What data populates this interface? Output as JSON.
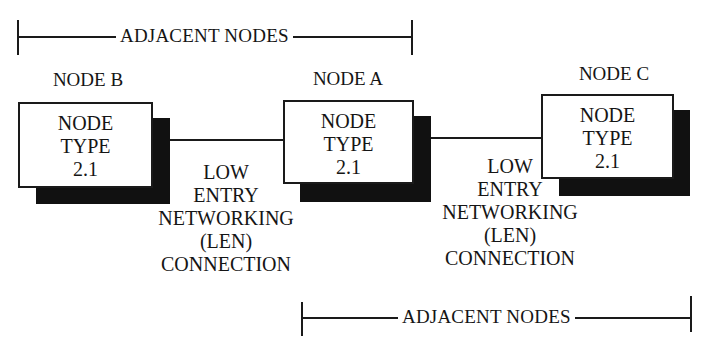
{
  "diagram": {
    "top_bracket": {
      "label": "ADJACENT NODES"
    },
    "bottom_bracket": {
      "label": "ADJACENT NODES"
    },
    "nodes": [
      {
        "id": "B",
        "title": "NODE B",
        "lines": [
          "NODE",
          "TYPE",
          "2.1"
        ]
      },
      {
        "id": "A",
        "title": "NODE A",
        "lines": [
          "NODE",
          "TYPE",
          "2.1"
        ]
      },
      {
        "id": "C",
        "title": "NODE C",
        "lines": [
          "NODE",
          "TYPE",
          "2.1"
        ]
      }
    ],
    "connections": [
      {
        "from": "B",
        "to": "A",
        "lines": [
          "LOW",
          "ENTRY",
          "NETWORKING",
          "(LEN)",
          "CONNECTION"
        ]
      },
      {
        "from": "A",
        "to": "C",
        "lines": [
          "LOW",
          "ENTRY",
          "NETWORKING",
          "(LEN)",
          "CONNECTION"
        ]
      }
    ],
    "colors": {
      "line": "#1a1a1a",
      "shadow": "#111111",
      "background": "#ffffff"
    }
  }
}
